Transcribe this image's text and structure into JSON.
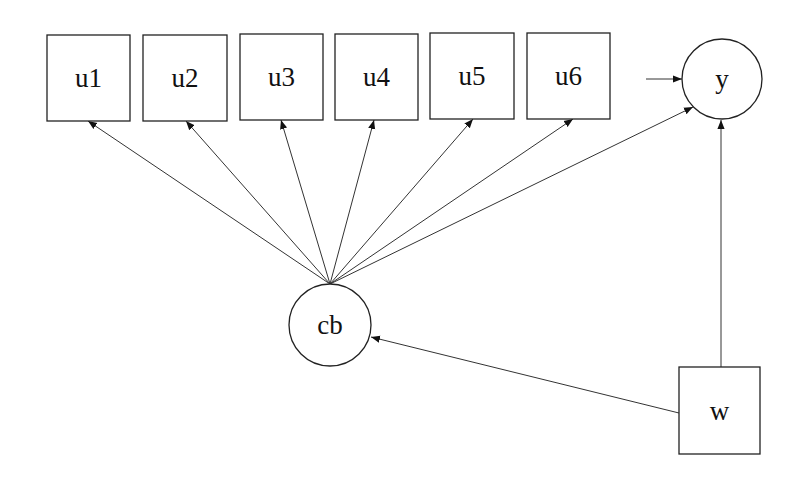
{
  "diagram": {
    "type": "path-diagram",
    "nodes": [
      {
        "id": "u1",
        "label": "u1",
        "shape": "rect",
        "x": 47,
        "y": 35,
        "w": 83,
        "h": 86
      },
      {
        "id": "u2",
        "label": "u2",
        "shape": "rect",
        "x": 143,
        "y": 35,
        "w": 84,
        "h": 86
      },
      {
        "id": "u3",
        "label": "u3",
        "shape": "rect",
        "x": 240,
        "y": 34,
        "w": 83,
        "h": 86
      },
      {
        "id": "u4",
        "label": "u4",
        "shape": "rect",
        "x": 335,
        "y": 34,
        "w": 83,
        "h": 86
      },
      {
        "id": "u5",
        "label": "u5",
        "shape": "rect",
        "x": 430,
        "y": 33,
        "w": 84,
        "h": 86
      },
      {
        "id": "u6",
        "label": "u6",
        "shape": "rect",
        "x": 527,
        "y": 33,
        "w": 83,
        "h": 86
      },
      {
        "id": "y",
        "label": "y",
        "shape": "circle",
        "cx": 722,
        "cy": 79,
        "r": 40
      },
      {
        "id": "cb",
        "label": "cb",
        "shape": "circle",
        "cx": 330,
        "cy": 325,
        "r": 41
      },
      {
        "id": "w",
        "label": "w",
        "shape": "rect",
        "x": 679,
        "y": 367,
        "w": 81,
        "h": 87
      }
    ],
    "edges": [
      {
        "from": "cb",
        "to": "u1",
        "x1": 330,
        "y1": 284,
        "x2": 88,
        "y2": 121
      },
      {
        "from": "cb",
        "to": "u2",
        "x1": 330,
        "y1": 284,
        "x2": 186,
        "y2": 121
      },
      {
        "from": "cb",
        "to": "u3",
        "x1": 330,
        "y1": 284,
        "x2": 281,
        "y2": 120
      },
      {
        "from": "cb",
        "to": "u4",
        "x1": 330,
        "y1": 284,
        "x2": 374,
        "y2": 120
      },
      {
        "from": "cb",
        "to": "u5",
        "x1": 330,
        "y1": 284,
        "x2": 473,
        "y2": 119
      },
      {
        "from": "cb",
        "to": "u6",
        "x1": 330,
        "y1": 284,
        "x2": 573,
        "y2": 119
      },
      {
        "from": "cb",
        "to": "y",
        "x1": 330,
        "y1": 284,
        "x2": 693,
        "y2": 107
      },
      {
        "from": "w",
        "to": "cb",
        "x1": 679,
        "y1": 413,
        "x2": 371,
        "y2": 337
      },
      {
        "from": "w",
        "to": "y",
        "x1": 721,
        "y1": 367,
        "x2": 721,
        "y2": 120
      },
      {
        "from": "residual",
        "to": "y",
        "x1": 646,
        "y1": 79,
        "x2": 682,
        "y2": 79
      }
    ]
  }
}
